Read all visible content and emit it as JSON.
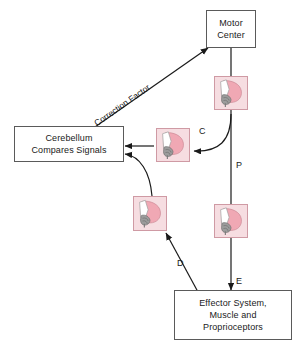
{
  "diagram": {
    "background_color": "#ffffff",
    "line_color": "#1a1a1a",
    "box_border_color": "#5a5a5a",
    "icon_background_color": "#f6dde1",
    "icon_border_color": "#cf9aa4",
    "icon_brain_color": "#f0a8b4",
    "icon_brainstem_color": "#8a8a8a"
  },
  "nodes": {
    "motor_center": {
      "lines": [
        "Motor",
        "Center"
      ],
      "line1": "Motor",
      "line2": "Center"
    },
    "cerebellum": {
      "lines": [
        "Cerebellum",
        "Compares Signals"
      ],
      "line1": "Cerebellum",
      "line2": "Compares Signals"
    },
    "effector": {
      "lines": [
        "Effector System,",
        "Muscle and",
        "Proprioceptors"
      ],
      "line1": "Effector System,",
      "line2": "Muscle and",
      "line3": "Proprioceptors"
    }
  },
  "icons": {
    "brain_top_right": "brain-sagittal-icon",
    "brain_middle_c": "brain-sagittal-icon",
    "brain_right_p": "brain-sagittal-icon",
    "brain_left_d": "brain-sagittal-icon"
  },
  "edges": {
    "correction_factor": "Correction Factor",
    "c": "C",
    "p": "P",
    "d": "D",
    "e": "E"
  }
}
